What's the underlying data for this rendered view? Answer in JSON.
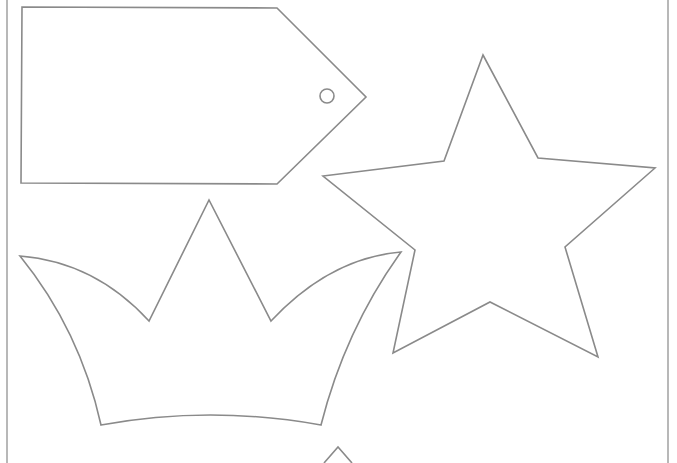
{
  "page": {
    "width": 677,
    "height": 463,
    "background": "#ffffff",
    "stroke_color": "#8a8a8a"
  },
  "shapes": {
    "tag": {
      "label": "gift-tag-outline",
      "points": "22,7 277,8 366,97 277,184 21,183",
      "hole": {
        "cx": 327,
        "cy": 96,
        "r": 7
      }
    },
    "star": {
      "label": "star-outline",
      "points": "483,55 538,158 655,168 565,247 598,357 490,302 393,353 415,250 323,176 444,161"
    },
    "crown": {
      "label": "crown-outline",
      "path": "M20,256 Q95,262 149,321 L209,200 L271,321 Q330,258 401,252 Q345,330 321,425 Q210,405 101,425 Q80,330 20,256 Z"
    },
    "partial_shape": {
      "label": "partial-shape-outline",
      "points": "324,463 338,447 352,463"
    }
  },
  "borders": {
    "left_x": 7,
    "right_x": 668
  }
}
